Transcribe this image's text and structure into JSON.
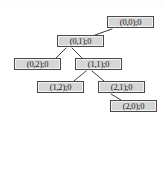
{
  "diagram": {
    "type": "tree",
    "title": "",
    "background_color": "#ffffff",
    "node_fill_color": "#d6d6d6",
    "node_border_color": "#4a4a4a",
    "edge_color": "#3c3c3c",
    "text_color": "#1a1a1a",
    "nodes": [
      {
        "id": "n00",
        "label": "(0,0);0",
        "state": "(0,0)",
        "value": "0",
        "x": 107,
        "y": 16,
        "width": 47,
        "height": 12,
        "depth": 0
      },
      {
        "id": "n01",
        "label": "(0,1);0",
        "state": "(0,1)",
        "value": "0",
        "x": 57,
        "y": 35,
        "width": 47,
        "height": 12,
        "depth": 1
      },
      {
        "id": "n02",
        "label": "(0,2);0",
        "state": "(0,2)",
        "value": "0",
        "x": 14,
        "y": 58,
        "width": 47,
        "height": 12,
        "depth": 2
      },
      {
        "id": "n11",
        "label": "(1,1);0",
        "state": "(1,1)",
        "value": "0",
        "x": 75,
        "y": 58,
        "width": 47,
        "height": 12,
        "depth": 2
      },
      {
        "id": "n12",
        "label": "(1,2);0",
        "state": "(1,2)",
        "value": "0",
        "x": 37,
        "y": 81,
        "width": 47,
        "height": 12,
        "depth": 3
      },
      {
        "id": "n21",
        "label": "(2,1);0",
        "state": "(2,1)",
        "value": "0",
        "x": 98,
        "y": 81,
        "width": 47,
        "height": 12,
        "depth": 3
      },
      {
        "id": "n20",
        "label": "(2,0);0",
        "state": "(2,0)",
        "value": "0",
        "x": 110,
        "y": 100,
        "width": 47,
        "height": 12,
        "depth": 4
      }
    ],
    "edges": [
      {
        "from": "n00",
        "to": "n01",
        "x1": 112,
        "y1": 29,
        "x2": 95,
        "y2": 35
      },
      {
        "from": "n01",
        "to": "n02",
        "x1": 66,
        "y1": 48,
        "x2": 56,
        "y2": 58
      },
      {
        "from": "n01",
        "to": "n11",
        "x1": 72,
        "y1": 48,
        "x2": 82,
        "y2": 58
      },
      {
        "from": "n11",
        "to": "n12",
        "x1": 86,
        "y1": 71,
        "x2": 74,
        "y2": 81
      },
      {
        "from": "n11",
        "to": "n21",
        "x1": 92,
        "y1": 71,
        "x2": 104,
        "y2": 81
      },
      {
        "from": "n21",
        "to": "n20",
        "x1": 111,
        "y1": 94,
        "x2": 121,
        "y2": 100
      }
    ]
  }
}
